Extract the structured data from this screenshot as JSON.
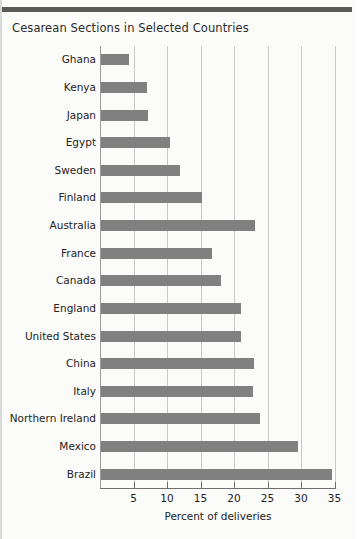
{
  "chart_data": {
    "type": "bar",
    "orientation": "horizontal",
    "title": "Cesarean Sections in Selected Countries",
    "xlabel": "Percent of deliveries",
    "ylabel": "",
    "categories": [
      "Ghana",
      "Kenya",
      "Japan",
      "Egypt",
      "Sweden",
      "Finland",
      "Australia",
      "France",
      "Canada",
      "England",
      "United States",
      "China",
      "Italy",
      "Northern Ireland",
      "Mexico",
      "Brazil"
    ],
    "values": [
      4.2,
      6.9,
      7.0,
      10.3,
      11.8,
      15.0,
      23.0,
      16.6,
      17.9,
      20.9,
      20.9,
      22.8,
      22.7,
      23.8,
      29.4,
      34.5
    ],
    "xlim": [
      0,
      36
    ],
    "xticks": [
      5,
      10,
      15,
      20,
      25,
      30,
      35
    ],
    "xtick_labels": [
      "5",
      "10",
      "15",
      "20",
      "25",
      "30",
      "35"
    ],
    "grid": "vertical",
    "legend": "none",
    "bar_color": "#808080",
    "gridline_color": "#c9c9c9",
    "axis_color": "#6f6f6f",
    "background_color": "#fbfbfa"
  }
}
